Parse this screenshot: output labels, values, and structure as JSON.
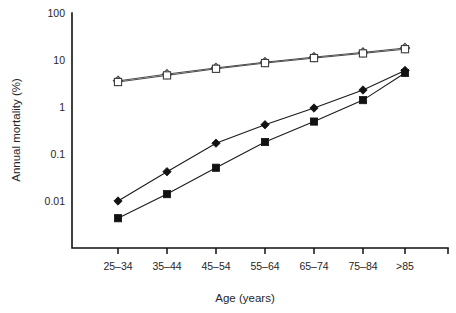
{
  "chart_data": {
    "type": "line",
    "title": "",
    "subtitle": "",
    "xlabel": "Age (years)",
    "ylabel": "Annual mortality (%)",
    "categories": [
      "25–34",
      "35–44",
      "45–54",
      "55–64",
      "65–74",
      "75–84",
      ">85"
    ],
    "y_scale": "log",
    "ylim": [
      0.01,
      100
    ],
    "y_ticks": [
      0.01,
      0.1,
      1,
      10,
      100
    ],
    "y_tick_labels": [
      "0.01",
      "0.1",
      "1",
      "10",
      "100"
    ],
    "grid": false,
    "legend": "none",
    "series": [
      {
        "name": "open-diamond-series",
        "marker": "open-diamond",
        "values": [
          3.6,
          5.0,
          6.8,
          9.0,
          11.5,
          14.5,
          18.0
        ]
      },
      {
        "name": "open-square-series",
        "marker": "open-square",
        "values": [
          3.4,
          4.7,
          6.5,
          8.6,
          11.0,
          13.8,
          17.0
        ]
      },
      {
        "name": "filled-diamond-series",
        "marker": "filled-diamond",
        "values": [
          0.01,
          0.042,
          0.17,
          0.42,
          0.95,
          2.3,
          6.0
        ]
      },
      {
        "name": "filled-square-series",
        "marker": "filled-square",
        "values": [
          0.0043,
          0.014,
          0.051,
          0.18,
          0.49,
          1.4,
          5.3
        ]
      }
    ]
  }
}
